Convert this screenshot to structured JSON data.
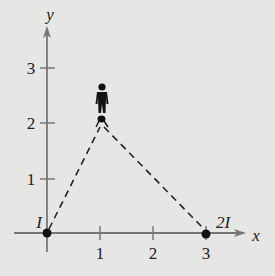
{
  "diagram": {
    "axes": {
      "x_label": "x",
      "y_label": "y",
      "x_ticks": [
        "1",
        "2",
        "3"
      ],
      "y_ticks": [
        "1",
        "2",
        "3"
      ]
    },
    "points": [
      {
        "name": "source-I",
        "label": "I",
        "x": 0,
        "y": 0
      },
      {
        "name": "source-2I",
        "label": "2I",
        "x": 3,
        "y": 0
      },
      {
        "name": "observer",
        "label": "",
        "x": 1,
        "y": 2
      }
    ],
    "colors": {
      "background": "#e6e6e4",
      "axis": "#777777",
      "ink": "#111111"
    }
  }
}
